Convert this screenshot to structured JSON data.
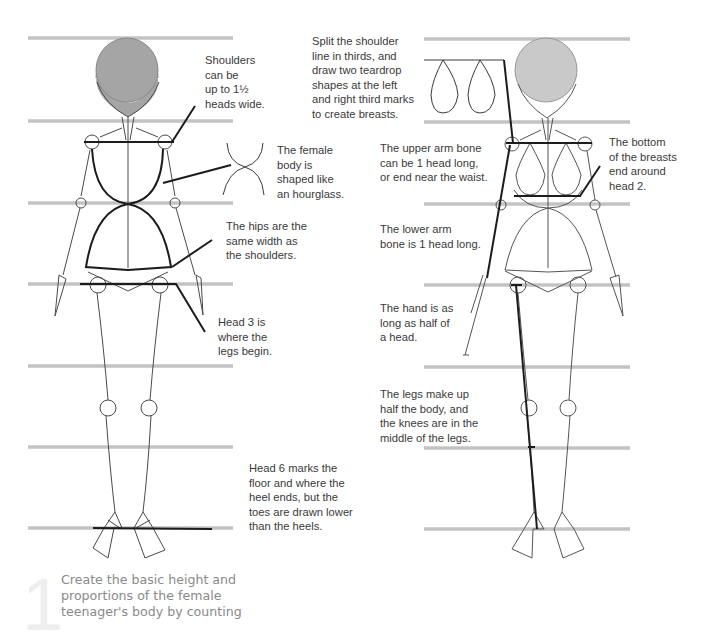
{
  "colors": {
    "guide_line": "#c3c3c3",
    "head_left": "#a5a5a5",
    "head_right": "#c9c9c9",
    "ink": "#1c1c1c",
    "thin_ink": "#4a4a4a",
    "text": "#3a3a3a",
    "step_text": "#8a8a8a"
  },
  "guides": {
    "y_positions": [
      38,
      121,
      203,
      284,
      366,
      447,
      528
    ],
    "left_x": [
      28,
      233
    ],
    "right_x": [
      424,
      630
    ]
  },
  "left_figure": {
    "annotations": [
      {
        "id": "shoulders",
        "text": "Shoulders\ncan be\nup to 1½\nheads wide."
      },
      {
        "id": "hourglass",
        "text": "The female\nbody is\nshaped like\nan hourglass."
      },
      {
        "id": "hips",
        "text": "The hips are the\nsame width as\nthe shoulders."
      },
      {
        "id": "head3",
        "text": "Head 3 is\nwhere the\nlegs begin."
      },
      {
        "id": "head6",
        "text": "Head 6 marks the\nfloor and where the\nheel ends, but the\ntoes are drawn lower\nthan the heels."
      }
    ]
  },
  "right_figure": {
    "annotations": [
      {
        "id": "breasts_split",
        "text": "Split the shoulder\nline in thirds, and\ndraw two teardrop\nshapes at the left\nand right third marks\nto create breasts."
      },
      {
        "id": "upper_arm",
        "text": "The upper arm bone\ncan be 1 head long,\nor end near the waist."
      },
      {
        "id": "breast_bottom",
        "text": "The bottom\nof the breasts\nend around\nhead 2."
      },
      {
        "id": "lower_arm",
        "text": "The lower arm\nbone is 1 head long."
      },
      {
        "id": "hand",
        "text": "The hand is as\nlong as half of\na head."
      },
      {
        "id": "legs",
        "text": "The legs make up\nhalf the body, and\nthe knees are in the\nmiddle of the legs."
      }
    ]
  },
  "step": {
    "number": "1",
    "text": "Create the basic height and\nproportions of the female\nteenager's body by counting"
  }
}
